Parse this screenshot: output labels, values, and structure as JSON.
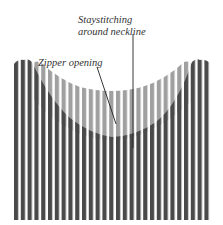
{
  "diagram": {
    "labels": {
      "staystitching_line1": "Staystitching",
      "staystitching_line2": "around neckline",
      "zipper": "Zipper opening"
    },
    "fabric": {
      "stripe_count": 29,
      "stripe_color_dark": "#4a4a4a",
      "stripe_color_light": "#9a9a9a",
      "background": "#ffffff"
    }
  }
}
